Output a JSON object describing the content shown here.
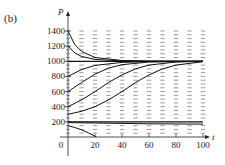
{
  "chart_data": {
    "type": "line",
    "subtype": "direction-field-with-solution-curves",
    "panel_label": "(b)",
    "title": "",
    "xlabel": "t",
    "ylabel": "P",
    "xlim": [
      0,
      100
    ],
    "ylim": [
      0,
      1400
    ],
    "x_ticks": [
      0,
      20,
      40,
      60,
      80,
      100
    ],
    "x_tick_labels": [
      "0",
      "20",
      "40",
      "60",
      "80",
      "100"
    ],
    "y_ticks": [
      200,
      400,
      600,
      800,
      1000,
      1200,
      1400
    ],
    "y_tick_labels": [
      "200",
      "400",
      "600",
      "800",
      "1000",
      "1200",
      "1400"
    ],
    "grid": false,
    "legend": null,
    "equilibria": [
      {
        "name": "P=1000",
        "value": 1000,
        "stability": "stable"
      },
      {
        "name": "P=200",
        "value": 200,
        "stability": "unstable"
      }
    ],
    "series": [
      {
        "name": "P0=1400",
        "x": [
          0,
          5,
          10,
          20,
          40,
          60,
          100
        ],
        "values": [
          1400,
          1220,
          1130,
          1050,
          1010,
          1002,
          1000
        ]
      },
      {
        "name": "P0=1200",
        "x": [
          0,
          5,
          10,
          20,
          40,
          60,
          100
        ],
        "values": [
          1200,
          1110,
          1065,
          1025,
          1005,
          1001,
          1000
        ]
      },
      {
        "name": "P0=1000",
        "x": [
          0,
          100
        ],
        "values": [
          1000,
          1000
        ]
      },
      {
        "name": "P0=800",
        "x": [
          0,
          10,
          20,
          40,
          60,
          100
        ],
        "values": [
          800,
          890,
          945,
          985,
          996,
          1000
        ]
      },
      {
        "name": "P0=600",
        "x": [
          0,
          10,
          20,
          30,
          40,
          60,
          100
        ],
        "values": [
          600,
          720,
          830,
          910,
          955,
          990,
          1000
        ]
      },
      {
        "name": "P0=400",
        "x": [
          0,
          10,
          20,
          30,
          40,
          50,
          60,
          80,
          100
        ],
        "values": [
          400,
          490,
          600,
          720,
          820,
          900,
          950,
          990,
          1000
        ]
      },
      {
        "name": "P0=300",
        "x": [
          0,
          10,
          20,
          30,
          40,
          50,
          60,
          70,
          80,
          100
        ],
        "values": [
          300,
          340,
          400,
          490,
          600,
          720,
          820,
          900,
          950,
          995
        ]
      },
      {
        "name": "P0=200",
        "x": [
          0,
          100
        ],
        "values": [
          200,
          200
        ]
      },
      {
        "name": "P0=190",
        "x": [
          0,
          20,
          40,
          60,
          100
        ],
        "values": [
          190,
          185,
          180,
          175,
          170
        ]
      },
      {
        "name": "P0=150",
        "x": [
          0,
          5,
          10,
          15,
          20,
          21
        ],
        "values": [
          150,
          125,
          95,
          55,
          10,
          0
        ]
      }
    ],
    "direction_field": {
      "t_columns": [
        10,
        20,
        30,
        40,
        50,
        60,
        70,
        80,
        90,
        100
      ],
      "p_rows": [
        50,
        100,
        150,
        250,
        300,
        350,
        400,
        450,
        500,
        550,
        600,
        650,
        700,
        750,
        800,
        850,
        900,
        950,
        1050,
        1100,
        1150,
        1200,
        1250,
        1300,
        1350,
        1400
      ]
    }
  }
}
